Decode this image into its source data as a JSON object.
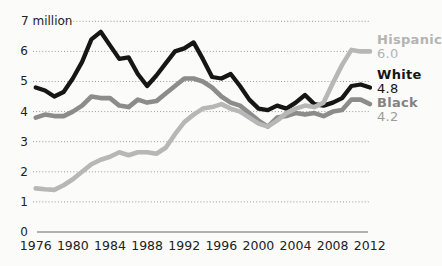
{
  "chart_data": {
    "type": "line",
    "title": "",
    "ylabel": "",
    "xlabel": "",
    "unit_label": "7 million",
    "ylim": [
      0,
      7
    ],
    "xlim": [
      1976,
      2012
    ],
    "grid": "dotted horizontal gridlines at each 1 million",
    "legend_position": "right, end-of-line labels",
    "yticks": [
      "7 million",
      "6",
      "5",
      "4",
      "3",
      "2",
      "1",
      "0"
    ],
    "xticks": [
      "1976",
      "1980",
      "1984",
      "1988",
      "1992",
      "1996",
      "2000",
      "2004",
      "2008",
      "2012"
    ],
    "x": [
      1976,
      1977,
      1978,
      1979,
      1980,
      1981,
      1982,
      1983,
      1984,
      1985,
      1986,
      1987,
      1988,
      1989,
      1990,
      1991,
      1992,
      1993,
      1994,
      1995,
      1996,
      1997,
      1998,
      1999,
      2000,
      2001,
      2002,
      2003,
      2004,
      2005,
      2006,
      2007,
      2008,
      2009,
      2010,
      2011,
      2012
    ],
    "series": [
      {
        "name": "White",
        "color": "#161616",
        "end_value_label": "4.8",
        "values": [
          4.8,
          4.7,
          4.5,
          4.65,
          5.1,
          5.65,
          6.4,
          6.65,
          6.2,
          5.75,
          5.8,
          5.25,
          4.85,
          5.2,
          5.6,
          6.0,
          6.1,
          6.3,
          5.75,
          5.15,
          5.1,
          5.25,
          4.85,
          4.4,
          4.1,
          4.05,
          4.2,
          4.1,
          4.3,
          4.55,
          4.25,
          4.2,
          4.3,
          4.45,
          4.85,
          4.9,
          4.8
        ]
      },
      {
        "name": "Black",
        "color": "#8c8c8c",
        "end_value_label": "4.2",
        "values": [
          3.8,
          3.9,
          3.85,
          3.85,
          4.0,
          4.2,
          4.5,
          4.45,
          4.45,
          4.2,
          4.15,
          4.4,
          4.3,
          4.35,
          4.6,
          4.85,
          5.1,
          5.1,
          5.0,
          4.8,
          4.5,
          4.3,
          4.2,
          3.95,
          3.7,
          3.5,
          3.8,
          3.85,
          3.95,
          3.9,
          3.95,
          3.85,
          4.0,
          4.05,
          4.4,
          4.4,
          4.25
        ]
      },
      {
        "name": "Hispanic",
        "color": "#b7b7b7",
        "end_value_label": "6.0",
        "values": [
          1.45,
          1.42,
          1.4,
          1.55,
          1.75,
          2.0,
          2.25,
          2.4,
          2.5,
          2.65,
          2.55,
          2.65,
          2.65,
          2.6,
          2.8,
          3.25,
          3.65,
          3.9,
          4.1,
          4.15,
          4.25,
          4.1,
          4.0,
          3.8,
          3.6,
          3.5,
          3.7,
          3.95,
          4.1,
          4.2,
          4.15,
          4.3,
          4.95,
          5.55,
          6.05,
          6.0,
          6.0
        ]
      }
    ]
  },
  "legend": {
    "items": [
      {
        "label": "Hispanic",
        "value": "6.0"
      },
      {
        "label": "White",
        "value": "4.8"
      },
      {
        "label": "Black",
        "value": "4.2"
      }
    ]
  },
  "colors": {
    "white_series": "#161616",
    "black_series": "#8c8c8c",
    "hispanic_series": "#b7b7b7",
    "gridline": "#9a9a9a",
    "axis": "#999999",
    "tick_text": "#222222",
    "background": "#fbfbf9"
  }
}
